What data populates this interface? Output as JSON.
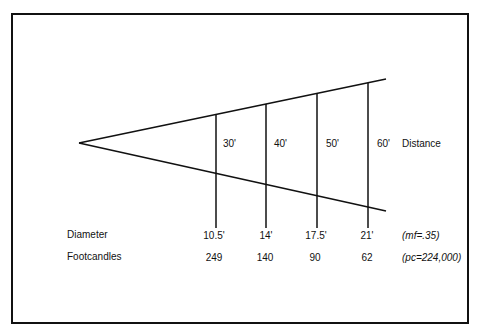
{
  "diagram": {
    "title": "",
    "distance_label": "Distance",
    "distances": [
      "30'",
      "40'",
      "50'",
      "60'"
    ],
    "rows": [
      {
        "label": "Diameter",
        "values": [
          "10.5'",
          "14'",
          "17.5'",
          "21'"
        ],
        "note": "(mf=.35)"
      },
      {
        "label": "Footcandles",
        "values": [
          "249",
          "140",
          "90",
          "62"
        ],
        "note": "(pc=224,000)"
      }
    ]
  }
}
